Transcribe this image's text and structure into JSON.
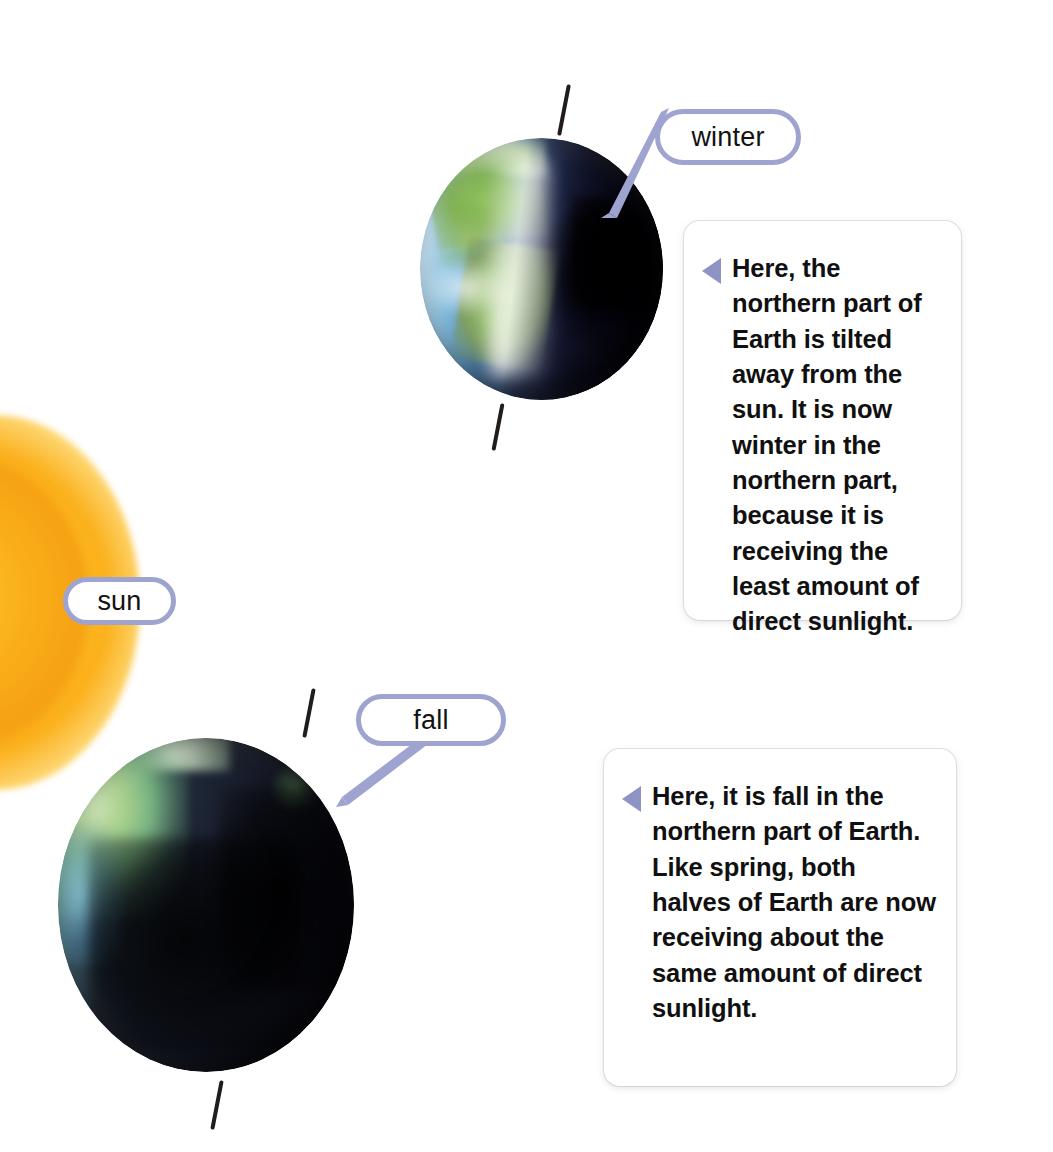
{
  "diagram": {
    "accent_color": "#9fa3cf",
    "bullet_color": "#8e94c6",
    "sun_color": "#f7a51e",
    "text_color": "#101010"
  },
  "sun": {
    "label": "sun",
    "icon": "sun-sphere-icon"
  },
  "globes": [
    {
      "id": "winter",
      "name": "earth-globe-winter",
      "label": "winter",
      "icon": "earth-globe-icon",
      "axis_icon": "tilt-axis-line-icon",
      "description": "Earth with the Americas lit on the left half and the right half in shadow"
    },
    {
      "id": "fall",
      "name": "earth-globe-fall",
      "label": "fall",
      "icon": "earth-globe-icon",
      "axis_icon": "tilt-axis-line-icon",
      "description": "Earth mostly in shadow with a lit green and blue crescent along the upper left rim"
    }
  ],
  "callouts": [
    {
      "id": "winter",
      "name": "callout-winter",
      "bullet_icon": "left-triangle-bullet-icon",
      "text": "Here, the northern part of Earth is tilted away from the sun. It is now winter in the northern part, because it is receiving the least amount of direct sunlight.",
      "lines": [
        "Here, the northern",
        "part of Earth is",
        "tilted away from the",
        "sun. It is now winter",
        "in the northern",
        "part, because it is",
        "receiving the least",
        "amount of direct",
        "sunlight."
      ]
    },
    {
      "id": "fall",
      "name": "callout-fall",
      "bullet_icon": "left-triangle-bullet-icon",
      "text": "Here, it is fall in the northern part of Earth. Like spring, both halves of Earth are now receiving about the same amount of direct sunlight.",
      "lines": [
        "Here, it is fall in",
        "the northern part",
        "of Earth. Like",
        "spring, both halves",
        "of Earth are now",
        "receiving about the",
        "same amount of",
        "direct sunlight."
      ]
    }
  ]
}
